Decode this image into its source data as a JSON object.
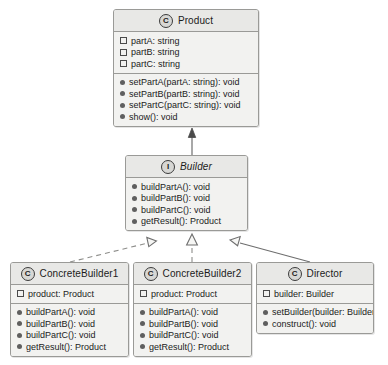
{
  "diagram": {
    "background": "#ffffff",
    "box_fill": "#f2f2f0",
    "header_fill": "#e8e8e6",
    "border_color": "#9a9a97",
    "text_color": "#1b1b1b"
  },
  "classes": {
    "product": {
      "name": "Product",
      "stereotype": "C",
      "kind": "class",
      "attributes": [
        "partA: string",
        "partB: string",
        "partC: string"
      ],
      "operations": [
        "setPartA(partA: string): void",
        "setPartB(partB: string): void",
        "setPartC(partC: string): void",
        "show(): void"
      ]
    },
    "builder": {
      "name": "Builder",
      "stereotype": "I",
      "kind": "interface",
      "attributes": [],
      "operations": [
        "buildPartA(): void",
        "buildPartB(): void",
        "buildPartC(): void",
        "getResult(): Product"
      ]
    },
    "concrete_builder_1": {
      "name": "ConcreteBuilder1",
      "stereotype": "C",
      "kind": "class",
      "attributes": [
        "product: Product"
      ],
      "operations": [
        "buildPartA(): void",
        "buildPartB(): void",
        "buildPartC(): void",
        "getResult(): Product"
      ]
    },
    "concrete_builder_2": {
      "name": "ConcreteBuilder2",
      "stereotype": "C",
      "kind": "class",
      "attributes": [
        "product: Product"
      ],
      "operations": [
        "buildPartA(): void",
        "buildPartB(): void",
        "buildPartC(): void",
        "getResult(): Product"
      ]
    },
    "director": {
      "name": "Director",
      "stereotype": "C",
      "kind": "class",
      "attributes": [
        "builder: Builder"
      ],
      "operations": [
        "setBuilder(builder: Builder): void",
        "construct(): void"
      ]
    }
  },
  "relationships": [
    {
      "name": "builder-to-product",
      "from": "builder",
      "to": "product",
      "style": "solid",
      "arrowhead": "filled-arrow",
      "type": "dependency"
    },
    {
      "name": "concretebuilder1-realizes-builder",
      "from": "concrete_builder_1",
      "to": "builder",
      "style": "dashed",
      "arrowhead": "hollow-triangle",
      "type": "realization"
    },
    {
      "name": "concretebuilder2-realizes-builder",
      "from": "concrete_builder_2",
      "to": "builder",
      "style": "dashed",
      "arrowhead": "hollow-triangle",
      "type": "realization"
    },
    {
      "name": "director-to-builder",
      "from": "director",
      "to": "builder",
      "style": "solid",
      "arrowhead": "hollow-triangle",
      "type": "generalization"
    }
  ]
}
